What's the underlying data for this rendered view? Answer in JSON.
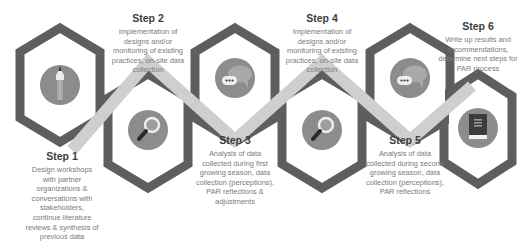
{
  "diagram": {
    "type": "process-flow",
    "colors": {
      "hex_outline": "#5e5e5e",
      "band": "#cfcfcf",
      "icon_circle": "#8c8c8c",
      "icon_dark": "#3a3a3a",
      "icon_light": "#e8e8e8",
      "title_text": "#3d3d3d",
      "body_text": "#7a7a7a"
    },
    "steps": [
      {
        "title": "Step 1",
        "icon": "pencil-icon",
        "lines": [
          "Design workshops",
          "with partner",
          "organizations &",
          "conversations with",
          "stakeholders,",
          "continue literature",
          "reviews & synthesis of",
          "previous data"
        ]
      },
      {
        "title": "Step 2",
        "icon": "magnifier-icon",
        "lines": [
          "Implementation of",
          "designs and/or",
          "monitoring of existing",
          "practices, on-site data",
          "collection"
        ]
      },
      {
        "title": "Step 3",
        "icon": "chat-bubbles-icon",
        "lines": [
          "Analysis of data",
          "collected during first",
          "growing season, data",
          "collection (perceptions),",
          "PAR reflections &",
          "adjustments"
        ]
      },
      {
        "title": "Step 4",
        "icon": "magnifier-icon",
        "lines": [
          "Implementation of",
          "designs and/or",
          "monitoring of existing",
          "practices, on-site data",
          "collection"
        ]
      },
      {
        "title": "Step 5",
        "icon": "chat-bubbles-icon",
        "lines": [
          "Analysis of data",
          "collected during second",
          "growing season, data",
          "collection (perceptions),",
          "PAR reflections"
        ]
      },
      {
        "title": "Step 6",
        "icon": "book-icon",
        "lines": [
          "Write up results and",
          "recommendations,",
          "determine next steps for",
          "PAR process"
        ]
      }
    ]
  }
}
